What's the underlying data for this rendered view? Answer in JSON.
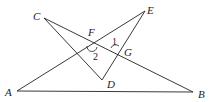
{
  "diagram": {
    "type": "geometry",
    "points": {
      "A": {
        "x": 17,
        "y": 91,
        "label": "A",
        "lx": 5,
        "ly": 96
      },
      "B": {
        "x": 193,
        "y": 92,
        "label": "B",
        "lx": 198,
        "ly": 98
      },
      "C": {
        "x": 44,
        "y": 18,
        "label": "C",
        "lx": 33,
        "ly": 20
      },
      "D": {
        "x": 102,
        "y": 80,
        "label": "D",
        "lx": 107,
        "ly": 88
      },
      "E": {
        "x": 145,
        "y": 11,
        "label": "E",
        "lx": 147,
        "ly": 14
      },
      "F": {
        "x": 92,
        "y": 44,
        "label": "F",
        "lx": 88,
        "ly": 36
      },
      "G": {
        "x": 116,
        "y": 50,
        "label": "G",
        "lx": 124,
        "ly": 56
      }
    },
    "segments": [
      [
        "A",
        "B"
      ],
      [
        "A",
        "E"
      ],
      [
        "C",
        "B"
      ],
      [
        "C",
        "D"
      ],
      [
        "D",
        "E"
      ]
    ],
    "angles": [
      {
        "label": "1",
        "x": 112,
        "y": 45
      },
      {
        "label": "2",
        "x": 93,
        "y": 60
      }
    ],
    "line_color": "#222222"
  }
}
